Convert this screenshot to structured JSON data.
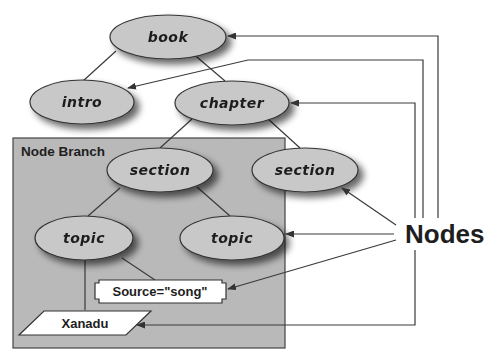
{
  "diagram": {
    "type": "tree-with-pointer-callouts",
    "colors": {
      "node_fill": "#c8c8c8",
      "branch_fill": "#b9b9b9",
      "stroke": "#333333",
      "background": "#ffffff"
    },
    "nodes": {
      "book": "book",
      "intro": "intro",
      "chapter": "chapter",
      "section_left": "section",
      "section_right": "section",
      "topic_left": "topic",
      "topic_right": "topic"
    },
    "branch": {
      "label": "Node Branch"
    },
    "attribute": {
      "label": "Source=\"song\""
    },
    "text_node": {
      "label": "Xanadu"
    },
    "callout": {
      "label": "Nodes"
    },
    "edges": [
      [
        "book",
        "intro"
      ],
      [
        "book",
        "chapter"
      ],
      [
        "chapter",
        "section_left"
      ],
      [
        "chapter",
        "section_right"
      ],
      [
        "section_left",
        "topic_left"
      ],
      [
        "section_left",
        "topic_right"
      ],
      [
        "topic_left",
        "Source=\"song\""
      ],
      [
        "topic_left",
        "Xanadu"
      ]
    ],
    "callout_targets": [
      "book",
      "intro",
      "chapter",
      "section_right",
      "topic_right",
      "Source=\"song\"",
      "Xanadu"
    ]
  }
}
